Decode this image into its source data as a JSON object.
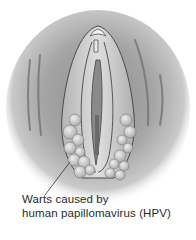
{
  "diagram": {
    "type": "medical-illustration",
    "colors": {
      "background": "#ffffff",
      "skin_dark": "#9a9a9a",
      "skin_light": "#d8d8d8",
      "outline": "#4a4a4a",
      "wart_fill": "#cfcfcf",
      "text": "#2a2a2a"
    },
    "label": {
      "line1": "Warts caused by",
      "line2": "human papillomavirus (HPV)"
    }
  }
}
